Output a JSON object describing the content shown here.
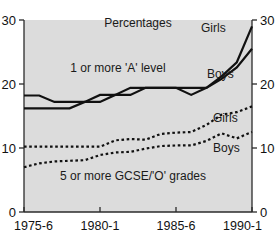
{
  "chart_data": {
    "type": "line",
    "title": "",
    "subtitle": "",
    "annotation_unit": "Percentages",
    "xlabel": "",
    "ylabel": "",
    "ylim": [
      0,
      30
    ],
    "y_ticks": [
      "0",
      "10",
      "20",
      "30"
    ],
    "y_tick_values": [
      0,
      10,
      20,
      30
    ],
    "x_tick_labels": [
      "1975-6",
      "1980-1",
      "1985-6",
      "1990-1"
    ],
    "x_tick_values": [
      1975,
      1980,
      1985,
      1990
    ],
    "x": [
      1975,
      1976,
      1977,
      1978,
      1979,
      1980,
      1981,
      1982,
      1983,
      1984,
      1985,
      1986,
      1987,
      1988,
      1989,
      1990
    ],
    "grid": false,
    "legend_position": "inline-right",
    "dual_y_axis": true,
    "group_labels": {
      "solid": "1 or more 'A' level",
      "dotted": "5 or more GCSE/'O' grades"
    },
    "series": [
      {
        "name": "Girls",
        "group": "1 or more 'A' level",
        "style": "solid",
        "label": "Girls",
        "values": [
          18.2,
          18.2,
          17.2,
          17.2,
          17.2,
          18.3,
          18.3,
          19.4,
          19.4,
          19.4,
          19.4,
          18.3,
          19.4,
          21.2,
          23.4,
          29.0
        ]
      },
      {
        "name": "Boys",
        "group": "1 or more 'A' level",
        "style": "solid",
        "label": "Boys",
        "values": [
          16.2,
          16.2,
          16.2,
          16.2,
          17.2,
          17.2,
          18.3,
          18.3,
          19.4,
          19.4,
          19.4,
          19.4,
          19.4,
          20.8,
          22.6,
          25.5
        ]
      },
      {
        "name": "Girls",
        "group": "5 or more GCSE/'O' grades",
        "style": "dotted",
        "label": "Girls",
        "values": [
          10.2,
          10.2,
          10.2,
          10.2,
          10.2,
          10.2,
          11.2,
          11.4,
          11.3,
          12.2,
          12.4,
          12.5,
          13.6,
          15.2,
          15.6,
          16.5
        ]
      },
      {
        "name": "Boys",
        "group": "5 or more GCSE/'O' grades",
        "style": "dotted",
        "label": "Boys",
        "values": [
          7.0,
          7.6,
          7.9,
          8.0,
          8.1,
          8.9,
          9.3,
          9.4,
          9.9,
          10.3,
          10.4,
          10.4,
          11.1,
          12.3,
          11.5,
          12.5
        ]
      }
    ],
    "labels": {
      "solid_girls": "Girls",
      "solid_boys": "Boys",
      "dotted_girls": "Girls",
      "dotted_boys": "Boys"
    },
    "colors": {
      "plot_background": "#dcdcdc",
      "line": "#111111",
      "axis": "#2b2b2b",
      "page_background": "#ffffff"
    }
  }
}
